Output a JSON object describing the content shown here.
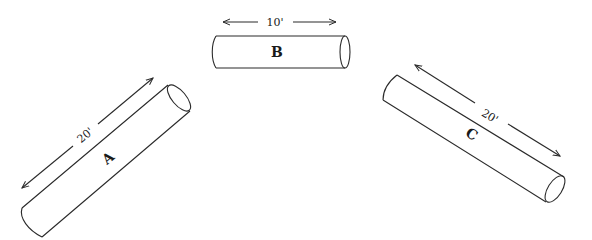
{
  "diagram": {
    "pipes": [
      {
        "id": "A",
        "label": "A",
        "dimension": "20'"
      },
      {
        "id": "B",
        "label": "B",
        "dimension": "10'"
      },
      {
        "id": "C",
        "label": "C",
        "dimension": "20'"
      }
    ],
    "colors": {
      "line": "#2a2a2a",
      "background": "#ffffff"
    }
  }
}
